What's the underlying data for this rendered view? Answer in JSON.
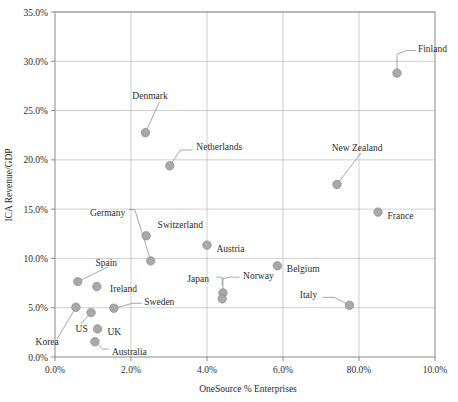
{
  "chart_data": {
    "type": "scatter",
    "title": "",
    "xlabel": "OneSource % Enterprises",
    "ylabel": "ICA Revenue/GDP",
    "xlim": [
      0,
      10
    ],
    "ylim": [
      0,
      35
    ],
    "grid": true,
    "legend": "none",
    "x_ticks": [
      0,
      2,
      4,
      6,
      8,
      10
    ],
    "x_tick_labels": [
      "0.0%",
      "2.0%",
      "4.0%",
      "6.0%",
      "80.0%",
      "10.0%"
    ],
    "y_ticks": [
      0,
      5,
      10,
      15,
      20,
      25,
      30,
      35
    ],
    "y_tick_labels": [
      "0.0%",
      "5.0%",
      "10.0%",
      "15.0%",
      "20.0%",
      "25.0%",
      "30.0%",
      "35.0%"
    ],
    "marker_color": "#a9a9a9",
    "marker_edge_color": "#8d8d8d",
    "points": [
      {
        "name": "Finland",
        "x": 9.0,
        "y": 28.8,
        "label_x": 9.55,
        "label_y": 31.3,
        "anchor": "start",
        "leader": [
          [
            9.0,
            28.8
          ],
          [
            9.0,
            30.7
          ],
          [
            9.25,
            31.1
          ],
          [
            9.5,
            31.1
          ]
        ]
      },
      {
        "name": "Denmark",
        "x": 2.38,
        "y": 22.75,
        "label_x": 2.5,
        "label_y": 26.5,
        "anchor": "middle",
        "leader": [
          [
            2.38,
            22.75
          ],
          [
            2.75,
            25.9
          ]
        ]
      },
      {
        "name": "Netherlands",
        "x": 3.02,
        "y": 19.4,
        "label_x": 3.72,
        "label_y": 21.4,
        "anchor": "start",
        "leader": [
          [
            3.02,
            19.4
          ],
          [
            3.3,
            21.0
          ],
          [
            3.62,
            21.0
          ]
        ]
      },
      {
        "name": "New Zealand",
        "x": 7.42,
        "y": 17.5,
        "label_x": 7.95,
        "label_y": 21.3,
        "anchor": "middle",
        "leader": [
          [
            7.42,
            17.5
          ],
          [
            8.05,
            20.7
          ]
        ]
      },
      {
        "name": "France",
        "x": 8.5,
        "y": 14.7,
        "label_x": 8.75,
        "label_y": 14.4,
        "anchor": "start",
        "leader": []
      },
      {
        "name": "Germany",
        "x": 2.52,
        "y": 9.75,
        "label_x": 1.85,
        "label_y": 14.7,
        "anchor": "end",
        "leader": [
          [
            2.52,
            9.75
          ],
          [
            2.1,
            14.95
          ],
          [
            1.95,
            14.95
          ]
        ]
      },
      {
        "name": "Switzerland",
        "x": 2.4,
        "y": 12.3,
        "label_x": 2.7,
        "label_y": 13.4,
        "anchor": "start",
        "leader": []
      },
      {
        "name": "Austria",
        "x": 4.0,
        "y": 11.35,
        "label_x": 4.25,
        "label_y": 11.05,
        "anchor": "start",
        "leader": []
      },
      {
        "name": "Belgium",
        "x": 5.85,
        "y": 9.25,
        "label_x": 6.1,
        "label_y": 8.95,
        "anchor": "start",
        "leader": []
      },
      {
        "name": "Spain",
        "x": 0.6,
        "y": 7.65,
        "label_x": 1.35,
        "label_y": 9.6,
        "anchor": "middle",
        "leader": [
          [
            0.6,
            7.65
          ],
          [
            1.4,
            9.15
          ]
        ]
      },
      {
        "name": "Ireland",
        "x": 1.1,
        "y": 7.15,
        "label_x": 1.45,
        "label_y": 6.9,
        "anchor": "start",
        "leader": []
      },
      {
        "name": "Norway",
        "x": 4.42,
        "y": 6.5,
        "label_x": 4.95,
        "label_y": 8.25,
        "anchor": "start",
        "leader": [
          [
            4.42,
            6.5
          ],
          [
            4.42,
            7.95
          ],
          [
            4.62,
            8.1
          ],
          [
            4.85,
            8.1
          ]
        ]
      },
      {
        "name": "Japan",
        "x": 4.4,
        "y": 5.9,
        "label_x": 4.05,
        "label_y": 8.0,
        "anchor": "end",
        "leader": [
          [
            4.25,
            8.1
          ],
          [
            4.4,
            8.1
          ],
          [
            4.4,
            7.3
          ]
        ]
      },
      {
        "name": "Italy",
        "x": 7.75,
        "y": 5.25,
        "label_x": 6.9,
        "label_y": 6.35,
        "anchor": "end",
        "leader": [
          [
            7.75,
            5.25
          ],
          [
            7.35,
            6.05
          ],
          [
            7.05,
            6.05
          ]
        ]
      },
      {
        "name": "Korea",
        "x": 0.55,
        "y": 5.05,
        "label_x": 0.1,
        "label_y": 1.55,
        "anchor": "end",
        "leader": [
          [
            0.55,
            5.05
          ],
          [
            0.05,
            1.8
          ],
          [
            0.05,
            1.8
          ]
        ]
      },
      {
        "name": "Sweden",
        "x": 1.55,
        "y": 4.95,
        "label_x": 2.35,
        "label_y": 5.6,
        "anchor": "start",
        "leader": [
          [
            1.55,
            4.95
          ],
          [
            2.05,
            5.45
          ],
          [
            2.28,
            5.45
          ]
        ]
      },
      {
        "name": "US",
        "x": 0.95,
        "y": 4.5,
        "label_x": 0.7,
        "label_y": 2.85,
        "anchor": "middle",
        "leader": [
          [
            0.95,
            4.5
          ],
          [
            0.68,
            3.35
          ]
        ]
      },
      {
        "name": "UK",
        "x": 1.12,
        "y": 2.85,
        "label_x": 1.38,
        "label_y": 2.6,
        "anchor": "start",
        "leader": []
      },
      {
        "name": "Australia",
        "x": 1.05,
        "y": 1.55,
        "label_x": 1.5,
        "label_y": 0.55,
        "anchor": "start",
        "leader": [
          [
            1.05,
            1.55
          ],
          [
            1.25,
            0.8
          ],
          [
            1.42,
            0.8
          ]
        ]
      }
    ]
  },
  "axes": {
    "x_title": "OneSource % Enterprises",
    "y_title": "ICA Revenue/GDP"
  }
}
